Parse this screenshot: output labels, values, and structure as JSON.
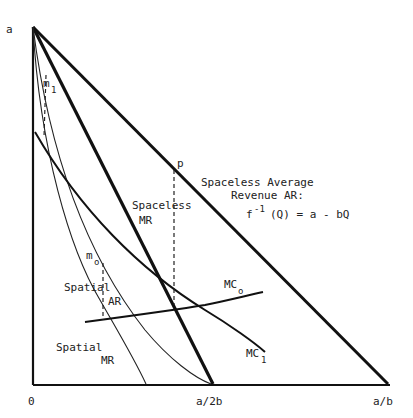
{
  "diagram": {
    "type": "economics-demand-revenue-diagram",
    "axes": {
      "origin_label": "0",
      "y_intercept_label": "a",
      "x_ticks": [
        "a/2b",
        "a/b"
      ]
    },
    "labels": {
      "point_p": "p",
      "m1": "m",
      "m1_sub": "1",
      "m0": "m",
      "m0_sub": "o",
      "spaceless_ar_line1": "Spaceless Average",
      "spaceless_ar_line2": "Revenue AR:",
      "spaceless_ar_formula_f": "f",
      "spaceless_ar_formula_exp": "-1",
      "spaceless_ar_formula_rest": "(Q) = a - bQ",
      "spaceless_mr_line1": "Spaceless",
      "spaceless_mr_line2": "MR",
      "spatial_ar_line1": "Spatial",
      "spatial_ar_line2": "AR",
      "spatial_mr_line1": "Spatial",
      "spatial_mr_line2": "MR",
      "mc0": "MC",
      "mc0_sub": "o",
      "mc1": "MC",
      "mc1_sub": "1"
    },
    "curves": [
      "Spaceless Average Revenue AR (a to a/b)",
      "Spaceless MR (a to a/2b)",
      "Spatial AR",
      "Spatial MR",
      "MC0",
      "MC1"
    ]
  }
}
